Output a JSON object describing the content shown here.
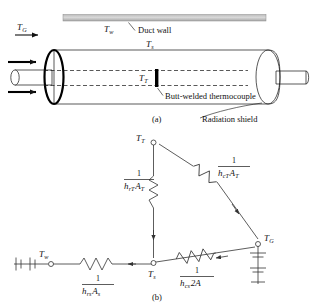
{
  "figure": {
    "panel_a": {
      "caption": "(a)",
      "labels": {
        "gas_temp": "T",
        "gas_temp_sub": "G",
        "wall_temp": "T",
        "wall_temp_sub": "w",
        "shield_temp": "T",
        "shield_temp_sub": "s",
        "thermocouple_temp": "T",
        "thermocouple_temp_sub": "T"
      },
      "annotations": {
        "duct_wall": "Duct wall",
        "thermocouple": "Butt-welded thermocouple",
        "radiation_shield": "Radiation shield"
      }
    },
    "panel_b": {
      "caption": "(b)",
      "nodes": [
        {
          "name": "thermocouple-node",
          "label": "T",
          "sub": "T"
        },
        {
          "name": "shield-node",
          "label": "T",
          "sub": "s"
        },
        {
          "name": "wall-node",
          "label": "T",
          "sub": "w"
        },
        {
          "name": "gas-node",
          "label": "T",
          "sub": "G"
        }
      ],
      "resistors": [
        {
          "name": "radiation-shield-to-thermocouple",
          "numerator": "1",
          "denom_h": "h",
          "denom_h_sub": "rT",
          "denom_a": "A",
          "denom_a_sub": "T"
        },
        {
          "name": "convection-gas-to-thermocouple",
          "numerator": "1",
          "denom_h": "h",
          "denom_h_sub": "cT",
          "denom_a": "A",
          "denom_a_sub": "T"
        },
        {
          "name": "radiation-shield-to-wall",
          "numerator": "1",
          "denom_h": "h",
          "denom_h_sub": "rs",
          "denom_a": "A",
          "denom_a_sub": "s"
        },
        {
          "name": "convection-gas-to-shield",
          "numerator": "1",
          "denom_h": "h",
          "denom_h_sub": "cs",
          "denom_a": "2A",
          "denom_a_sub": ""
        }
      ]
    }
  },
  "colors": {
    "line": "#111111",
    "wire": "#333333",
    "duct_wall_fill": "#c9c9c9",
    "shield_fill": "#f2f2f2",
    "background": "#ffffff"
  }
}
